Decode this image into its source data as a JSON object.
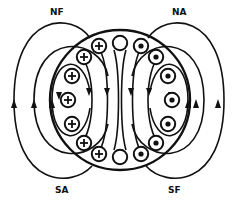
{
  "diagram": {
    "labels": {
      "top_left": "NF",
      "top_right": "NA",
      "bottom_left": "SA",
      "bottom_right": "SF"
    },
    "conductors": {
      "left_symbol": "plus (current into page)",
      "right_symbol": "dot (current out of page)",
      "neutral_symbol": "empty (no current)",
      "left_count": 7,
      "right_count": 7,
      "neutral_count": 2
    },
    "colors": {
      "line": "#111111",
      "background": "#ffffff"
    }
  }
}
